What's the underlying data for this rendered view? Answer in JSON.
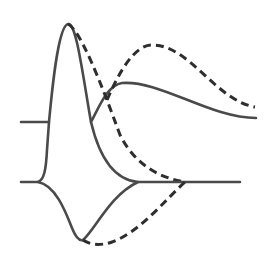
{
  "diagram": {
    "colors": {
      "solid_stroke": "#4a4a4a",
      "dashed_stroke": "#2e2e2e",
      "background": "#ffffff"
    },
    "upper_trace": {
      "baseline_y": 122,
      "solid": "M21,122 L49,122 C52,90 58,26 68,24 C76,22 82,70 91,122 C100,105 108,85 122,83 C160,80 210,118 256,118",
      "dashed": "M68,24 C80,30 100,80 120,135 C135,165 160,178 185,182",
      "dashed_second_wave": "M107,100 C120,70 135,45 152,45 C190,45 215,100 255,107"
    },
    "lower_trace": {
      "baseline_y": 182,
      "solid_rise": "M21,182 L38,182 C44,180 46,170 47,150 L49,122",
      "solid_descent": "M91,122 C100,160 115,180 138,182",
      "solid_trough": "M38,182 C55,185 65,210 72,228 C76,238 80,241 83,240 C95,230 110,195 138,182 L240,182",
      "dashed_trough": "M83,240 C90,245 100,246 112,242 C140,232 165,200 185,182"
    }
  }
}
